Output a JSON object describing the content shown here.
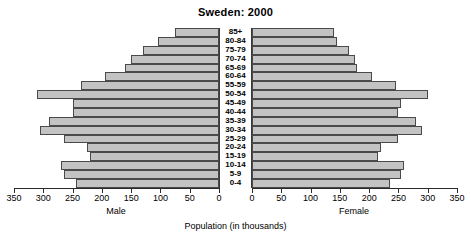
{
  "chart": {
    "title": "Sweden: 2000",
    "caption": "Population (in thousands)",
    "male_label": "Male",
    "female_label": "Female"
  },
  "chart_data": {
    "type": "bar",
    "subtype": "population-pyramid",
    "title": "Sweden: 2000",
    "xlabel": "Population (in thousands)",
    "ylabel": "",
    "orientation": "horizontal",
    "grid": false,
    "legend": false,
    "axis_max": 350,
    "axis_tick_step": 50,
    "left_axis": {
      "name": "Male",
      "direction": "reversed",
      "ticks": [
        350,
        300,
        250,
        200,
        150,
        100,
        50,
        0
      ]
    },
    "right_axis": {
      "name": "Female",
      "direction": "normal",
      "ticks": [
        0,
        50,
        100,
        150,
        200,
        250,
        300,
        350
      ]
    },
    "categories": [
      "85+",
      "80-84",
      "75-79",
      "70-74",
      "65-69",
      "60-64",
      "55-59",
      "50-54",
      "45-49",
      "40-44",
      "35-39",
      "30-34",
      "25-29",
      "20-24",
      "15-19",
      "10-14",
      "5-9",
      "0-4"
    ],
    "series": [
      {
        "name": "Male",
        "values": [
          75,
          105,
          130,
          150,
          160,
          195,
          235,
          310,
          250,
          250,
          290,
          305,
          265,
          225,
          220,
          270,
          265,
          245
        ]
      },
      {
        "name": "Female",
        "values": [
          140,
          145,
          165,
          175,
          180,
          205,
          245,
          300,
          255,
          250,
          280,
          290,
          250,
          220,
          215,
          260,
          255,
          235
        ]
      }
    ]
  }
}
